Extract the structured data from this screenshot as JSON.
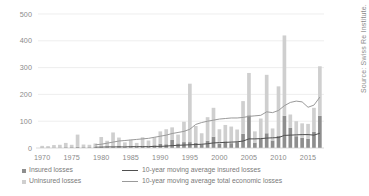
{
  "source_note": "Source: Swiss Re Institute.",
  "legend": {
    "insured": {
      "label": "Insured losses",
      "color": "#8e8e8e",
      "marker": "square-swatch"
    },
    "uninsured": {
      "label": "Uninsured losses",
      "color": "#cfcfcf",
      "marker": "square-swatch"
    },
    "ma_insured": {
      "label": "10-year moving average insured losses",
      "color": "#4f4f4f",
      "marker": "line-swatch"
    },
    "ma_total": {
      "label": "10-year moving average total economic losses",
      "color": "#9a9a9a",
      "marker": "line-swatch"
    }
  },
  "chart_data": {
    "type": "bar",
    "title": "",
    "xlabel": "",
    "ylabel": "",
    "ylim": [
      0,
      500
    ],
    "yticks": [
      0,
      100,
      200,
      300,
      400,
      500
    ],
    "ytick_labels": [
      "0",
      "100",
      "200",
      "300",
      "400",
      "500"
    ],
    "grid": true,
    "grid_axis": "y",
    "legend_position": "bottom-left",
    "stacked": true,
    "x": [
      1970,
      1971,
      1972,
      1973,
      1974,
      1975,
      1976,
      1977,
      1978,
      1979,
      1980,
      1981,
      1982,
      1983,
      1984,
      1985,
      1986,
      1987,
      1988,
      1989,
      1990,
      1991,
      1992,
      1993,
      1994,
      1995,
      1996,
      1997,
      1998,
      1999,
      2000,
      2001,
      2002,
      2003,
      2004,
      2005,
      2006,
      2007,
      2008,
      2009,
      2010,
      2011,
      2012,
      2013,
      2014,
      2015,
      2016,
      2017
    ],
    "xticks": [
      1970,
      1975,
      1980,
      1985,
      1990,
      1995,
      2000,
      2005,
      2010,
      2015
    ],
    "xtick_labels": [
      "1970",
      "1975",
      "1980",
      "1985",
      "1990",
      "1995",
      "2000",
      "2005",
      "2010",
      "2015"
    ],
    "xlim": [
      1969.3,
      2017.7
    ],
    "series": [
      {
        "name": "Insured losses",
        "color": "#8e8e8e",
        "values": [
          2,
          2,
          2,
          2,
          3,
          3,
          4,
          3,
          3,
          5,
          6,
          4,
          5,
          7,
          5,
          6,
          5,
          7,
          6,
          10,
          16,
          14,
          30,
          17,
          22,
          22,
          19,
          14,
          27,
          42,
          16,
          25,
          18,
          22,
          53,
          122,
          20,
          34,
          55,
          28,
          46,
          120,
          75,
          44,
          38,
          35,
          60,
          120
        ]
      },
      {
        "name": "Uninsured losses",
        "color": "#cfcfcf",
        "values": [
          6,
          5,
          9,
          10,
          16,
          9,
          46,
          10,
          9,
          12,
          35,
          23,
          53,
          32,
          16,
          25,
          14,
          33,
          22,
          30,
          46,
          56,
          47,
          33,
          76,
          218,
          63,
          41,
          88,
          108,
          54,
          61,
          62,
          47,
          122,
          158,
          42,
          76,
          218,
          45,
          184,
          300,
          50,
          56,
          54,
          55,
          90,
          185
        ]
      }
    ],
    "lines": [
      {
        "name": "10-year moving average insured losses",
        "color": "#4f4f4f",
        "x": [
          1979,
          1980,
          1981,
          1982,
          1983,
          1984,
          1985,
          1986,
          1987,
          1988,
          1989,
          1990,
          1991,
          1992,
          1993,
          1994,
          1995,
          1996,
          1997,
          1998,
          1999,
          2000,
          2001,
          2002,
          2003,
          2004,
          2005,
          2006,
          2007,
          2008,
          2009,
          2010,
          2011,
          2012,
          2013,
          2014,
          2015,
          2016,
          2017
        ],
        "values": [
          3,
          3,
          4,
          4,
          4,
          4,
          5,
          5,
          5,
          5,
          6,
          6,
          7,
          9,
          10,
          11,
          12,
          13,
          14,
          16,
          19,
          20,
          21,
          22,
          23,
          26,
          34,
          34,
          35,
          37,
          38,
          39,
          47,
          48,
          49,
          50,
          50,
          48,
          55
        ]
      },
      {
        "name": "10-year moving average total economic losses",
        "color": "#9a9a9a",
        "x": [
          1979,
          1980,
          1981,
          1982,
          1983,
          1984,
          1985,
          1986,
          1987,
          1988,
          1989,
          1990,
          1991,
          1992,
          1993,
          1994,
          1995,
          1996,
          1997,
          1998,
          1999,
          2000,
          2001,
          2002,
          2003,
          2004,
          2005,
          2006,
          2007,
          2008,
          2009,
          2010,
          2011,
          2012,
          2013,
          2014,
          2015,
          2016,
          2017
        ],
        "values": [
          12,
          14,
          18,
          22,
          26,
          28,
          30,
          32,
          34,
          36,
          40,
          44,
          48,
          54,
          58,
          62,
          70,
          88,
          95,
          100,
          104,
          108,
          110,
          112,
          112,
          114,
          118,
          120,
          122,
          135,
          132,
          140,
          158,
          170,
          175,
          172,
          152,
          160,
          190
        ]
      }
    ]
  }
}
